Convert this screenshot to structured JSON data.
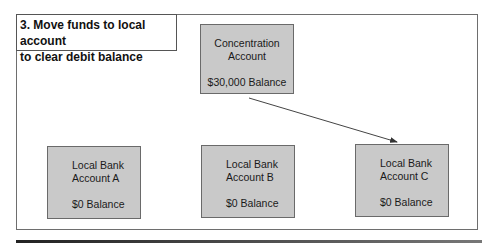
{
  "title": {
    "line1": "3. Move funds to local account",
    "line2": "to clear debit balance"
  },
  "concentration": {
    "line1": "Concentration",
    "line2": "Account",
    "balance": "$30,000 Balance"
  },
  "local_accounts": [
    {
      "line1": "Local Bank",
      "line2": "Account A",
      "balance": "$0 Balance"
    },
    {
      "line1": "Local Bank",
      "line2": "Account B",
      "balance": "$0 Balance"
    },
    {
      "line1": "Local Bank",
      "line2": "Account C",
      "balance": "$0 Balance"
    }
  ],
  "arrow": {
    "from": "Concentration Account",
    "to": "Local Bank Account C"
  },
  "colors": {
    "box_fill": "#c9c9c9",
    "box_border": "#6a6a6a",
    "frame": "#6e6e6e"
  }
}
